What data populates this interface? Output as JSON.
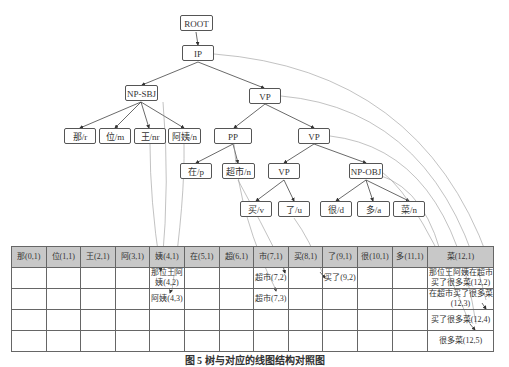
{
  "tree": {
    "nodes": {
      "root": "ROOT",
      "ip": "IP",
      "np_sbj": "NP-SBJ",
      "vp1": "VP",
      "na": "那/r",
      "wei": "位/m",
      "wang": "王/nr",
      "ayi": "阿姨/n",
      "pp": "PP",
      "vp2": "VP",
      "zai": "在/p",
      "chaoshi": "超市/n",
      "vp3": "VP",
      "np_obj": "NP-OBJ",
      "mai": "买/v",
      "le": "了/u",
      "hen": "很/d",
      "duo": "多/a",
      "cai": "菜/n"
    }
  },
  "table": {
    "header": [
      "那(0,1)",
      "位(1,1)",
      "王(2,1)",
      "阿(3,1)",
      "姨(4,1)",
      "在(5,1)",
      "超(6,1)",
      "市(7,1)",
      "买(8,1)",
      "了(9,1)",
      "很(10,1)",
      "多(11,1)",
      "菜(12,1)"
    ],
    "rows": [
      [
        "",
        "",
        "",
        "",
        "那位王阿姨(4,2)",
        "",
        "",
        "超市(7,2)",
        "",
        "买了(9,2)",
        "",
        "",
        "那位王阿姨在超市买了很多菜(12,2)"
      ],
      [
        "",
        "",
        "",
        "",
        "阿姨(4,3)",
        "",
        "",
        "超市(7,3)",
        "",
        "",
        "",
        "",
        "在超市买了很多菜(12,3)"
      ],
      [
        "",
        "",
        "",
        "",
        "",
        "",
        "",
        "",
        "",
        "",
        "",
        "",
        "买了很多菜(12,4)"
      ],
      [
        "",
        "",
        "",
        "",
        "",
        "",
        "",
        "",
        "",
        "",
        "",
        "",
        "很多菜(12,5)"
      ]
    ]
  },
  "caption": "图 5  树与对应的线图结构对照图"
}
